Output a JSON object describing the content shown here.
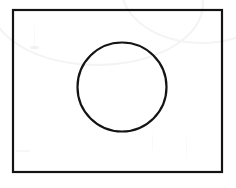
{
  "figure": {
    "title": "Circle inscribed in rectangle",
    "background_color": "#ffffff",
    "stroke_color": "#141414",
    "fill_color": "none",
    "canvas": {
      "width": 236,
      "height": 188
    },
    "shapes": [
      {
        "name": "rectangle",
        "kind": "rect",
        "x": 13,
        "y": 10,
        "width": 209,
        "height": 162,
        "stroke_width": 2.2,
        "stroke_color": "#141414",
        "fill": "none",
        "label": "rectangle-outline"
      },
      {
        "name": "circle",
        "kind": "circle",
        "center_x": 122,
        "center_y": 87,
        "radius": 44.5,
        "stroke_width": 2.2,
        "stroke_color": "#141414",
        "fill": "none",
        "label": "circle-outline"
      }
    ],
    "artifacts": [
      {
        "name": "arc-smudge-top",
        "kind": "faint-arc",
        "color": "#f2f2f2"
      },
      {
        "name": "arc-smudge-top-right",
        "kind": "faint-arc",
        "color": "#f4f4f4"
      },
      {
        "name": "streak-left",
        "kind": "faint-streak"
      },
      {
        "name": "streak-bottom-right-1",
        "kind": "faint-streak"
      },
      {
        "name": "streak-bottom-right-2",
        "kind": "faint-streak"
      },
      {
        "name": "smudge-upper-left",
        "kind": "faint-smudge"
      },
      {
        "name": "smudge-lower-left",
        "kind": "faint-smudge"
      }
    ]
  }
}
